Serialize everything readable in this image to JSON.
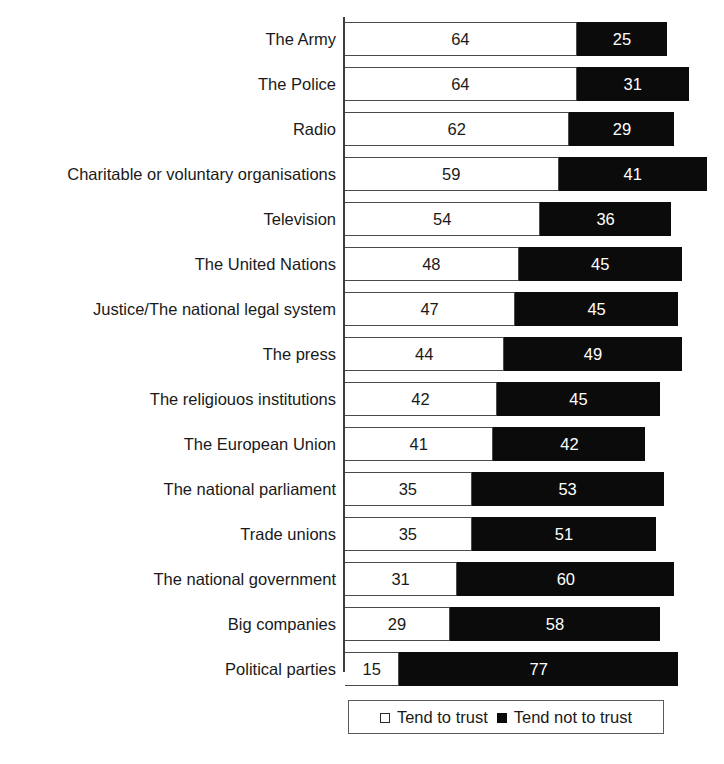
{
  "chart_data": {
    "type": "bar",
    "orientation": "horizontal",
    "stacked": true,
    "title": "",
    "subtitle": "",
    "xlabel": "",
    "ylabel": "",
    "xlim": [
      0,
      100
    ],
    "grid": false,
    "legend_position": "bottom",
    "categories": [
      "The Army",
      "The Police",
      "Radio",
      "Charitable or voluntary organisations",
      "Television",
      "The United Nations",
      "Justice/The national legal system",
      "The press",
      "The religiouos institutions",
      "The European Union",
      "The national parliament",
      "Trade unions",
      "The national government",
      "Big companies",
      "Political parties"
    ],
    "series": [
      {
        "name": "Tend to trust",
        "color": "#ffffff",
        "values": [
          64,
          64,
          62,
          59,
          54,
          48,
          47,
          44,
          42,
          41,
          35,
          35,
          31,
          29,
          15
        ]
      },
      {
        "name": "Tend not to trust",
        "color": "#0b0b0b",
        "values": [
          25,
          31,
          29,
          41,
          36,
          45,
          45,
          49,
          45,
          42,
          53,
          51,
          60,
          58,
          77
        ]
      }
    ]
  },
  "legend": {
    "items": [
      {
        "label": "Tend to trust",
        "marker": "open-square"
      },
      {
        "label": "Tend not to trust",
        "marker": "filled-square"
      }
    ]
  },
  "style": {
    "axis_color": "#3c3c3c",
    "trust_fill": "#ffffff",
    "distrust_fill": "#0b0b0b",
    "text_color": "#1a1a1a",
    "px_per_unit": 3.62
  }
}
